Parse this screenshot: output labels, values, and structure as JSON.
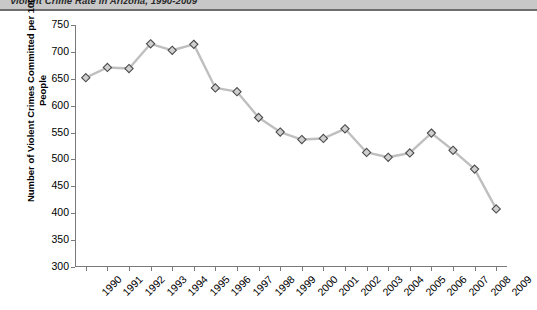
{
  "header": {
    "title": "Violent Crime Rate in Arizona, 1990-2009"
  },
  "axes": {
    "y_title_line1": "Number of Violent Crimes Committed per 100,000",
    "y_title_line2": "People"
  },
  "chart_data": {
    "type": "line",
    "title": "Violent Crime Rate in Arizona, 1990-2009",
    "xlabel": "",
    "ylabel": "Number of Violent Crimes Committed per 100,000 People",
    "ylim": [
      300,
      750
    ],
    "ytick_labels": [
      "300",
      "350",
      "400",
      "450",
      "500",
      "550",
      "600",
      "650",
      "700",
      "750"
    ],
    "yticks": [
      300,
      350,
      400,
      450,
      500,
      550,
      600,
      650,
      700,
      750
    ],
    "grid": false,
    "legend": "none",
    "marker": "diamond",
    "categories": [
      "1990",
      "1991",
      "1992",
      "1993",
      "1994",
      "1995",
      "1996",
      "1997",
      "1998",
      "1999",
      "2000",
      "2001",
      "2002",
      "2003",
      "2004",
      "2005",
      "2006",
      "2007",
      "2008",
      "2009"
    ],
    "values": [
      652,
      671,
      669,
      715,
      703,
      714,
      633,
      626,
      578,
      551,
      537,
      539,
      557,
      513,
      504,
      512,
      549,
      517,
      482,
      408
    ]
  }
}
